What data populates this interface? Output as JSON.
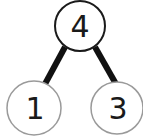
{
  "diagram": {
    "type": "number-bond",
    "whole": {
      "value": "4",
      "border_color": "#1a1a1a"
    },
    "parts": [
      {
        "value": "1",
        "border_color": "#9a9a9a"
      },
      {
        "value": "3",
        "border_color": "#9a9a9a"
      }
    ],
    "connector_color": "#111111"
  }
}
